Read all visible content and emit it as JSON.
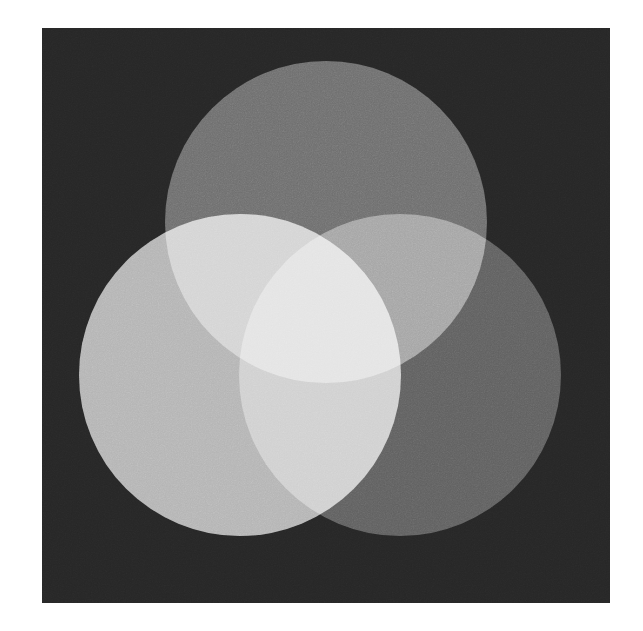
{
  "figure": {
    "kind": "venn-three-circle-additive",
    "canvas": {
      "width": 643,
      "height": 631,
      "page_background": "#ffffff"
    },
    "panel": {
      "name": "plot-panel",
      "x": 42,
      "y": 28,
      "width": 568,
      "height": 575,
      "background_color": "#262626",
      "grain_opacity": 0.3
    }
  },
  "chart_data": {
    "type": "venn",
    "xlabel": "",
    "ylabel": "",
    "grid": false,
    "legend_position": "none",
    "background_color": "#262626",
    "blend_mode": "screen",
    "radius": 161,
    "sets": [
      {
        "name": "top",
        "label": "Top disc",
        "cx": 326,
        "cy": 222,
        "r": 161,
        "color": "#6e6e6e",
        "alone_value": 0.43
      },
      {
        "name": "left",
        "label": "Left disc",
        "cx": 240,
        "cy": 375,
        "r": 161,
        "color": "#b4b4b4",
        "alone_value": 0.71
      },
      {
        "name": "right",
        "label": "Right disc",
        "cx": 400,
        "cy": 375,
        "r": 161,
        "color": "#606060",
        "alone_value": 0.38
      }
    ],
    "regions": [
      {
        "name": "background",
        "members": [],
        "color": "#262626"
      },
      {
        "name": "top-only",
        "members": [
          "top"
        ],
        "color": "#6e6e6e"
      },
      {
        "name": "left-only",
        "members": [
          "left"
        ],
        "color": "#b4b4b4"
      },
      {
        "name": "right-only",
        "members": [
          "right"
        ],
        "color": "#606060"
      },
      {
        "name": "top-left",
        "members": [
          "top",
          "left"
        ],
        "color": "#e8e8e8"
      },
      {
        "name": "top-right",
        "members": [
          "top",
          "right"
        ],
        "color": "#757575"
      },
      {
        "name": "left-right",
        "members": [
          "left",
          "right"
        ],
        "color": "#dcdcdc"
      },
      {
        "name": "all-three",
        "members": [
          "top",
          "left",
          "right"
        ],
        "color": "#ffffff"
      }
    ],
    "intersection_points": [
      {
        "name": "lower-center",
        "x": 322,
        "y": 518
      }
    ]
  }
}
